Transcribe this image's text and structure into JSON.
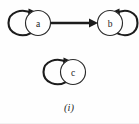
{
  "figure": {
    "caption": "(i)",
    "background_color": "#fefefe",
    "stroke_color": "#1c1c1c",
    "node_fill_color": "#ffffff"
  },
  "graph": {
    "type": "directed-graph",
    "nodes": [
      {
        "id": "a",
        "label": "a",
        "cx": 38,
        "cy": 23,
        "r": 12.5,
        "self_loop": true,
        "self_loop_side": "left"
      },
      {
        "id": "b",
        "label": "b",
        "cx": 110,
        "cy": 23,
        "r": 12.5,
        "self_loop": true,
        "self_loop_side": "right"
      },
      {
        "id": "c",
        "label": "c",
        "cx": 73,
        "cy": 72,
        "r": 12.5,
        "self_loop": true,
        "self_loop_side": "left"
      }
    ],
    "edges": [
      {
        "from": "a",
        "to": "b",
        "directed": true,
        "style": "straight"
      }
    ]
  }
}
